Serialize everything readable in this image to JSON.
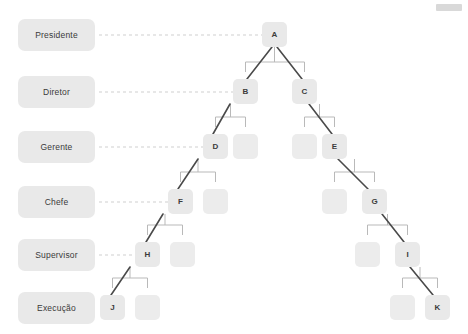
{
  "diagram": {
    "type": "org-tree",
    "levels": [
      {
        "label": "Presidente",
        "y": 19
      },
      {
        "label": "Diretor",
        "y": 76
      },
      {
        "label": "Gerente",
        "y": 131
      },
      {
        "label": "Chefe",
        "y": 186
      },
      {
        "label": "Supervisor",
        "y": 239
      },
      {
        "label": "Execução",
        "y": 292
      }
    ],
    "nodes": [
      {
        "id": "A",
        "label": "A",
        "x": 262,
        "y": 22,
        "level": 0,
        "filled": true
      },
      {
        "id": "B",
        "label": "B",
        "x": 233,
        "y": 79,
        "level": 1,
        "filled": true
      },
      {
        "id": "C",
        "label": "C",
        "x": 292,
        "y": 79,
        "level": 1,
        "filled": true
      },
      {
        "id": "D",
        "label": "D",
        "x": 203,
        "y": 134,
        "level": 2,
        "filled": true
      },
      {
        "id": "n1",
        "label": "",
        "x": 233,
        "y": 134,
        "level": 2,
        "filled": false
      },
      {
        "id": "n2",
        "label": "",
        "x": 292,
        "y": 134,
        "level": 2,
        "filled": false
      },
      {
        "id": "E",
        "label": "E",
        "x": 322,
        "y": 134,
        "level": 2,
        "filled": true
      },
      {
        "id": "F",
        "label": "F",
        "x": 168,
        "y": 189,
        "level": 3,
        "filled": true
      },
      {
        "id": "n3",
        "label": "",
        "x": 203,
        "y": 189,
        "level": 3,
        "filled": false
      },
      {
        "id": "n4",
        "label": "",
        "x": 322,
        "y": 189,
        "level": 3,
        "filled": false
      },
      {
        "id": "G",
        "label": "G",
        "x": 362,
        "y": 189,
        "level": 3,
        "filled": true
      },
      {
        "id": "H",
        "label": "H",
        "x": 135,
        "y": 242,
        "level": 4,
        "filled": true
      },
      {
        "id": "n5",
        "label": "",
        "x": 170,
        "y": 242,
        "level": 4,
        "filled": false
      },
      {
        "id": "n6",
        "label": "",
        "x": 355,
        "y": 242,
        "level": 4,
        "filled": false
      },
      {
        "id": "I",
        "label": "I",
        "x": 395,
        "y": 242,
        "level": 4,
        "filled": true
      },
      {
        "id": "J",
        "label": "J",
        "x": 100,
        "y": 295,
        "level": 5,
        "filled": true
      },
      {
        "id": "n7",
        "label": "",
        "x": 135,
        "y": 295,
        "level": 5,
        "filled": false
      },
      {
        "id": "n8",
        "label": "",
        "x": 390,
        "y": 295,
        "level": 5,
        "filled": false
      },
      {
        "id": "K",
        "label": "K",
        "x": 425,
        "y": 295,
        "level": 5,
        "filled": true
      }
    ],
    "highlighted_paths": [
      [
        "A",
        "B",
        "D",
        "F",
        "H",
        "J"
      ],
      [
        "A",
        "C",
        "E",
        "G",
        "I",
        "K"
      ]
    ],
    "colors": {
      "box_fill": "#e9e9e9",
      "connector": "#b9b9b9",
      "dashed_guide": "#cfcfcf",
      "highlight": "#4a4a4a",
      "text": "#3a3a3a",
      "background": "#ffffff"
    }
  }
}
